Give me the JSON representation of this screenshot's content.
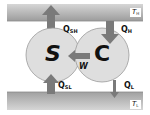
{
  "diagram": {
    "type": "thermodynamic-cycle",
    "reservoirs": {
      "hot": {
        "label": "T",
        "subscript": "H"
      },
      "cold": {
        "label": "T",
        "subscript": "L"
      }
    },
    "devices": [
      {
        "id": "S",
        "label": "S"
      },
      {
        "id": "C",
        "label": "C"
      }
    ],
    "flows": [
      {
        "id": "QSH",
        "label": "Q",
        "subscript": "SH",
        "from": "S",
        "to": "hot"
      },
      {
        "id": "QH",
        "label": "Q",
        "subscript": "H",
        "from": "hot",
        "to": "C"
      },
      {
        "id": "W",
        "label": "W",
        "subscript": "",
        "from": "C",
        "to": "S"
      },
      {
        "id": "QSL",
        "label": "Q",
        "subscript": "SL",
        "from": "cold",
        "to": "S"
      },
      {
        "id": "QL",
        "label": "Q",
        "subscript": "L",
        "from": "C",
        "to": "cold"
      }
    ],
    "colors": {
      "reservoir_light": "#d4d4d4",
      "reservoir_dark": "#9a9a9a",
      "circle_fill": "#dedede",
      "circle_stroke": "#9a9a9a",
      "arrow": "#7a7a7a"
    }
  }
}
